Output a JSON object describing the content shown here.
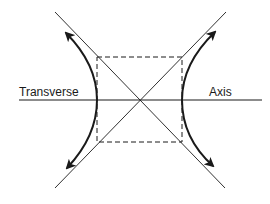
{
  "diagram": {
    "labels": {
      "left": "Transverse",
      "right": "Axis"
    },
    "colors": {
      "line": "#1a1a1a",
      "background": "#ffffff"
    },
    "elements": [
      {
        "name": "transverse-axis",
        "type": "line"
      },
      {
        "name": "asymptote-1",
        "type": "line"
      },
      {
        "name": "asymptote-2",
        "type": "line"
      },
      {
        "name": "central-rectangle",
        "type": "dashed-rect"
      },
      {
        "name": "left-branch",
        "type": "curve-with-arrows"
      },
      {
        "name": "right-branch",
        "type": "curve-with-arrows"
      }
    ]
  }
}
